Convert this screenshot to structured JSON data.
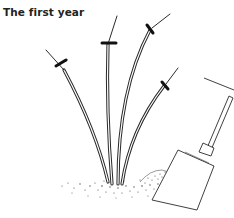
{
  "figure": {
    "caption": "The first year",
    "elements": {
      "stems": [
        {
          "name": "stem-left",
          "cut_mark": true
        },
        {
          "name": "stem-center-left",
          "cut_mark": true
        },
        {
          "name": "stem-center-right",
          "cut_mark": true
        },
        {
          "name": "stem-right",
          "cut_mark": true
        }
      ],
      "tool": "spade",
      "ground": "soil-mound"
    },
    "colors": {
      "ink": "#222222",
      "background": "#ffffff"
    }
  }
}
